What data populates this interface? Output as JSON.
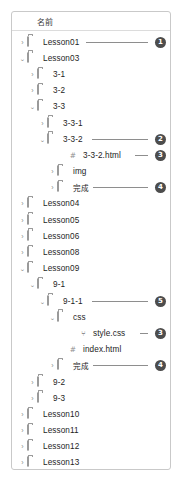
{
  "panel": {
    "header": {
      "label": "名前"
    },
    "rows": [
      {
        "label": "Lesson01",
        "indent": 0,
        "type": "folder",
        "state": "collapsed",
        "marker": "1"
      },
      {
        "label": "Lesson03",
        "indent": 0,
        "type": "folder",
        "state": "expanded",
        "marker": ""
      },
      {
        "label": "3-1",
        "indent": 1,
        "type": "folder",
        "state": "collapsed",
        "marker": ""
      },
      {
        "label": "3-2",
        "indent": 1,
        "type": "folder",
        "state": "collapsed",
        "marker": ""
      },
      {
        "label": "3-3",
        "indent": 1,
        "type": "folder",
        "state": "expanded",
        "marker": ""
      },
      {
        "label": "3-3-1",
        "indent": 2,
        "type": "folder",
        "state": "collapsed",
        "marker": ""
      },
      {
        "label": "3-3-2",
        "indent": 2,
        "type": "folder",
        "state": "expanded",
        "marker": "2"
      },
      {
        "label": "3-3-2.html",
        "indent": 4,
        "type": "html",
        "state": "leaf",
        "marker": "3"
      },
      {
        "label": "img",
        "indent": 3,
        "type": "folder",
        "state": "collapsed",
        "marker": ""
      },
      {
        "label": "完成",
        "indent": 3,
        "type": "folder",
        "state": "collapsed",
        "marker": "4",
        "jp": true
      },
      {
        "label": "Lesson04",
        "indent": 0,
        "type": "folder",
        "state": "collapsed",
        "marker": ""
      },
      {
        "label": "Lesson05",
        "indent": 0,
        "type": "folder",
        "state": "collapsed",
        "marker": ""
      },
      {
        "label": "Lesson06",
        "indent": 0,
        "type": "folder",
        "state": "collapsed",
        "marker": ""
      },
      {
        "label": "Lesson08",
        "indent": 0,
        "type": "folder",
        "state": "collapsed",
        "marker": ""
      },
      {
        "label": "Lesson09",
        "indent": 0,
        "type": "folder",
        "state": "expanded",
        "marker": ""
      },
      {
        "label": "9-1",
        "indent": 1,
        "type": "folder",
        "state": "expanded",
        "marker": ""
      },
      {
        "label": "9-1-1",
        "indent": 2,
        "type": "folder",
        "state": "expanded",
        "marker": "5"
      },
      {
        "label": "css",
        "indent": 3,
        "type": "folder",
        "state": "expanded",
        "marker": ""
      },
      {
        "label": "style.css",
        "indent": 5,
        "type": "css",
        "state": "leaf",
        "marker": "3"
      },
      {
        "label": "index.html",
        "indent": 4,
        "type": "html",
        "state": "leaf",
        "marker": ""
      },
      {
        "label": "完成",
        "indent": 3,
        "type": "folder",
        "state": "collapsed",
        "marker": "4",
        "jp": true
      },
      {
        "label": "9-2",
        "indent": 1,
        "type": "folder",
        "state": "collapsed",
        "marker": ""
      },
      {
        "label": "9-3",
        "indent": 1,
        "type": "folder",
        "state": "collapsed",
        "marker": ""
      },
      {
        "label": "Lesson10",
        "indent": 0,
        "type": "folder",
        "state": "collapsed",
        "marker": ""
      },
      {
        "label": "Lesson11",
        "indent": 0,
        "type": "folder",
        "state": "collapsed",
        "marker": ""
      },
      {
        "label": "Lesson12",
        "indent": 0,
        "type": "folder",
        "state": "collapsed",
        "marker": ""
      },
      {
        "label": "Lesson13",
        "indent": 0,
        "type": "folder",
        "state": "collapsed",
        "marker": ""
      },
      {
        "label": "Lesson14",
        "indent": 0,
        "type": "folder",
        "state": "expanded",
        "marker": ""
      },
      {
        "label": "14-2",
        "indent": 1,
        "type": "folder",
        "state": "collapsed",
        "marker": ""
      },
      {
        "label": "14-3",
        "indent": 1,
        "type": "folder",
        "state": "collapsed",
        "marker": ""
      },
      {
        "label": "14-4",
        "indent": 1,
        "type": "folder",
        "state": "collapsed",
        "marker": ""
      },
      {
        "label": "14-5",
        "indent": 1,
        "type": "folder",
        "state": "collapsed",
        "marker": ""
      },
      {
        "label": "完成サイト",
        "indent": 1,
        "type": "folder",
        "state": "collapsed",
        "marker": "6",
        "jp": true
      },
      {
        "label": "素材",
        "indent": 0,
        "type": "folder",
        "state": "expanded",
        "marker": "7",
        "jp": true
      }
    ],
    "glyphs": {
      "collapsed": "›",
      "expanded": "⌄",
      "html_icon": "#",
      "css_icon": "⑂"
    },
    "colors": {
      "marker_bg": "#4d4d4d",
      "marker_fg": "#ffffff",
      "leader_line": "#8e8e8e",
      "border": "#c9c9c9",
      "text": "#1d1d1d"
    }
  }
}
